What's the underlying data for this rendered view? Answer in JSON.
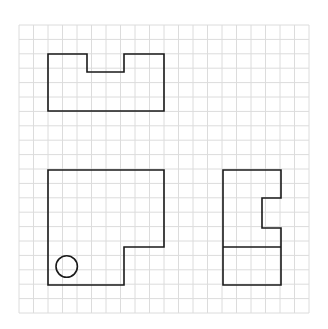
{
  "diagram": {
    "type": "orthographic-projection-views",
    "background": "#ffffff",
    "grid": {
      "x0": 19,
      "y0": 25,
      "cols": 20,
      "rows": 20,
      "cell_w": 14.5,
      "cell_h": 14.4,
      "color": "#dcdcdc"
    },
    "stroke_color": "#1a1a1a",
    "shapes": [
      {
        "name": "top-view-shape",
        "kind": "polygon",
        "points": [
          [
            48,
            54
          ],
          [
            87,
            54
          ],
          [
            87,
            72
          ],
          [
            124,
            72
          ],
          [
            124,
            54
          ],
          [
            164,
            54
          ],
          [
            164,
            111
          ],
          [
            48,
            111
          ]
        ]
      },
      {
        "name": "front-view-shape",
        "kind": "polygon",
        "points": [
          [
            48,
            170
          ],
          [
            164,
            170
          ],
          [
            164,
            247
          ],
          [
            124,
            247
          ],
          [
            124,
            285
          ],
          [
            48,
            285
          ]
        ]
      },
      {
        "name": "front-view-hole-circle",
        "kind": "circle",
        "cx": 66.7,
        "cy": 266.5,
        "r": 10.7
      },
      {
        "name": "side-view-shape",
        "kind": "polygon",
        "points": [
          [
            223,
            170
          ],
          [
            281,
            170
          ],
          [
            281,
            198
          ],
          [
            262,
            198
          ],
          [
            262,
            228
          ],
          [
            281,
            228
          ],
          [
            281,
            285
          ],
          [
            223,
            285
          ]
        ]
      },
      {
        "name": "side-view-divider-line",
        "kind": "line",
        "x1": 223,
        "y1": 247,
        "x2": 281,
        "y2": 247
      }
    ]
  }
}
